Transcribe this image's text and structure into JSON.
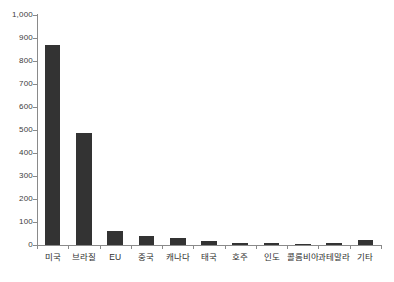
{
  "chart_data": {
    "type": "bar",
    "title": "",
    "subtitle": "",
    "xlabel": "",
    "ylabel": "",
    "categories": [
      "미국",
      "브라질",
      "EU",
      "중국",
      "캐나다",
      "태국",
      "호주",
      "인도",
      "콜롬비아",
      "과테말라",
      "기타"
    ],
    "values": [
      870,
      485,
      62,
      40,
      30,
      16,
      10,
      7,
      6,
      7,
      20
    ],
    "ylim": [
      0,
      1000
    ],
    "ytick_labels": [
      "1,000",
      "900",
      "800",
      "700",
      "600",
      "500",
      "400",
      "300",
      "200",
      "100",
      "0"
    ],
    "ytick_values": [
      1000,
      900,
      800,
      700,
      600,
      500,
      400,
      300,
      200,
      100,
      0
    ],
    "grid": false,
    "legend": null,
    "legend_position": "none",
    "series": [
      {
        "name": "",
        "values": [
          870,
          485,
          62,
          40,
          30,
          16,
          10,
          7,
          6,
          7,
          20
        ]
      }
    ],
    "colors": {
      "bar": "#333333",
      "axis": "#8a8a8a",
      "text": "#2e2e2e",
      "background": "#ffffff"
    }
  }
}
